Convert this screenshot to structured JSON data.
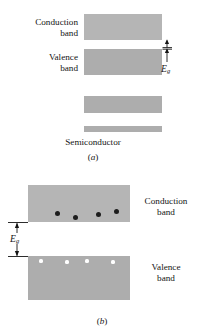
{
  "figure": {
    "background_color": "#ffffff",
    "band_color": "#b5b5b5",
    "band_color_dark": "#adadad",
    "electron_color": "#1d1d1d",
    "hole_color": "#ffffff",
    "line_color": "#151515"
  },
  "panel_a": {
    "letter": "a",
    "letter_open": "(",
    "letter_close": ")",
    "conduction_label": "Conduction\nband",
    "valence_label": "Valence\nband",
    "material_label": "Semiconductor",
    "gap_label": "E",
    "gap_subscript": "g",
    "bands": [
      {
        "name": "conduction-band",
        "x": 84,
        "y": 14,
        "w": 78,
        "h": 26
      },
      {
        "name": "valence-band",
        "x": 84,
        "y": 49,
        "w": 78,
        "h": 26
      },
      {
        "name": "lower-band-1",
        "x": 84,
        "y": 96,
        "w": 78,
        "h": 17
      },
      {
        "name": "lower-band-2",
        "x": 84,
        "y": 126,
        "w": 78,
        "h": 6
      }
    ]
  },
  "panel_b": {
    "letter": "b",
    "letter_open": "(",
    "letter_close": ")",
    "conduction_label": "Conduction\nband",
    "valence_label": "Valence\nband",
    "gap_label": "E",
    "gap_subscript": "g",
    "bands": [
      {
        "name": "conduction-band",
        "x": 28,
        "y": 185,
        "w": 102,
        "h": 37
      },
      {
        "name": "valence-band",
        "x": 28,
        "y": 256,
        "w": 102,
        "h": 44
      }
    ],
    "electrons": [
      {
        "cx": 57,
        "cy": 213
      },
      {
        "cx": 75,
        "cy": 217
      },
      {
        "cx": 98,
        "cy": 214
      },
      {
        "cx": 116,
        "cy": 211
      }
    ],
    "holes": [
      {
        "cx": 41,
        "cy": 261
      },
      {
        "cx": 67,
        "cy": 262
      },
      {
        "cx": 87,
        "cy": 261
      },
      {
        "cx": 113,
        "cy": 262
      }
    ]
  }
}
